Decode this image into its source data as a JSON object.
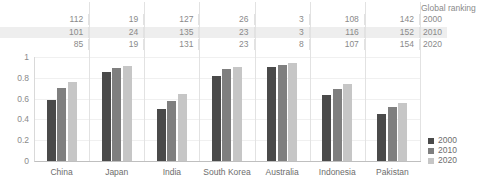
{
  "table": {
    "header_label": "Global ranking",
    "row_labels": [
      "2000",
      "2010",
      "2020"
    ],
    "columns": [
      "China",
      "Japan",
      "India",
      "South Korea",
      "Australia",
      "Indonesia",
      "Pakistan"
    ],
    "rows": [
      [
        "112",
        "19",
        "127",
        "26",
        "3",
        "108",
        "142"
      ],
      [
        "101",
        "24",
        "135",
        "23",
        "3",
        "116",
        "152"
      ],
      [
        "85",
        "19",
        "131",
        "23",
        "8",
        "107",
        "154"
      ]
    ]
  },
  "legend": {
    "items": [
      {
        "label": "2000",
        "color": "#4a4a4a"
      },
      {
        "label": "2010",
        "color": "#7f7f7f"
      },
      {
        "label": "2020",
        "color": "#c6c6c6"
      }
    ]
  },
  "chart_data": {
    "type": "bar",
    "title": "",
    "xlabel": "",
    "ylabel": "",
    "ylim": [
      0,
      1
    ],
    "yticks": [
      "0",
      "0.2",
      "0.4",
      "0.6",
      "0.8",
      "1"
    ],
    "grid": true,
    "legend_position": "right",
    "categories": [
      "China",
      "Japan",
      "India",
      "South Korea",
      "Australia",
      "Indonesia",
      "Pakistan"
    ],
    "series": [
      {
        "name": "2000",
        "color": "#4a4a4a",
        "values": [
          0.59,
          0.86,
          0.5,
          0.82,
          0.9,
          0.63,
          0.45
        ]
      },
      {
        "name": "2010",
        "color": "#7f7f7f",
        "values": [
          0.7,
          0.89,
          0.58,
          0.88,
          0.92,
          0.69,
          0.52
        ]
      },
      {
        "name": "2020",
        "color": "#c6c6c6",
        "values": [
          0.76,
          0.91,
          0.64,
          0.9,
          0.94,
          0.74,
          0.56
        ]
      }
    ]
  }
}
